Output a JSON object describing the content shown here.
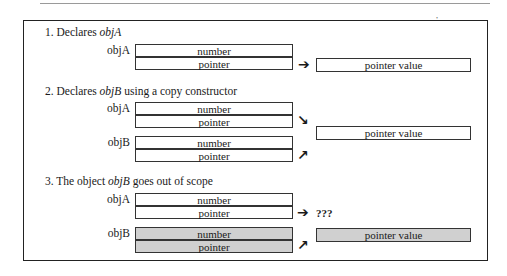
{
  "steps": [
    {
      "number": "1.",
      "prefix": "Declares",
      "object": "objA",
      "suffix": "",
      "objects": [
        {
          "name": "objA",
          "fields": [
            "number",
            "pointer"
          ],
          "shaded": false
        }
      ],
      "targets": [
        {
          "label": "pointer value",
          "shaded": false
        }
      ]
    },
    {
      "number": "2.",
      "prefix": "Declares",
      "object": "objB",
      "suffix": "using a copy constructor",
      "objects": [
        {
          "name": "objA",
          "fields": [
            "number",
            "pointer"
          ],
          "shaded": false
        },
        {
          "name": "objB",
          "fields": [
            "number",
            "pointer"
          ],
          "shaded": false
        }
      ],
      "targets": [
        {
          "label": "pointer value",
          "shaded": false
        }
      ]
    },
    {
      "number": "3.",
      "prefix": "The object",
      "object": "objB",
      "suffix": "goes out of scope",
      "objects": [
        {
          "name": "objA",
          "fields": [
            "number",
            "pointer"
          ],
          "shaded": false
        },
        {
          "name": "objB",
          "fields": [
            "number",
            "pointer"
          ],
          "shaded": true
        }
      ],
      "dangling_label": "???",
      "targets": [
        {
          "label": "pointer value",
          "shaded": true
        }
      ]
    }
  ],
  "arrows": {
    "right": "➔",
    "down_right": "↘",
    "up_right": "↗"
  },
  "colors": {
    "shaded": "#d0d0d0",
    "border": "#333333"
  }
}
